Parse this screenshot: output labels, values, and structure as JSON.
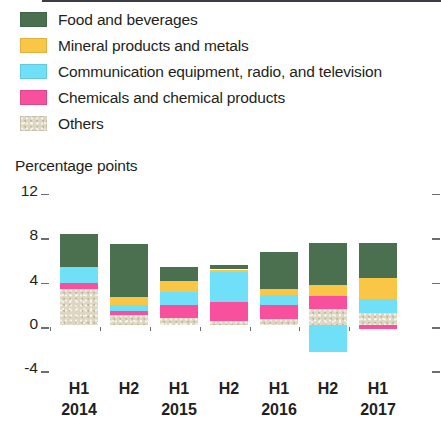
{
  "legend": {
    "items": [
      {
        "label": "Food and beverages",
        "color": "#4a7050",
        "key": "food"
      },
      {
        "label": "Mineral products and metals",
        "color": "#f9c646",
        "key": "mineral"
      },
      {
        "label": "Communication equipment, radio, and television",
        "color": "#6fe0f7",
        "key": "comm"
      },
      {
        "label": "Chemicals and chemical products",
        "color": "#f8509d",
        "key": "chem"
      },
      {
        "label": "Others",
        "color": "#ddd6c1",
        "key": "other"
      }
    ]
  },
  "chart_data": {
    "type": "bar",
    "stacked": true,
    "title": "",
    "subtitle": "",
    "ylabel": "Percentage points",
    "xlabel": "",
    "ylim": [
      -4,
      12
    ],
    "yticks": [
      12,
      8,
      4,
      0,
      -4
    ],
    "ytick_labels": [
      "12",
      "8",
      "4",
      "0",
      "-4"
    ],
    "grid": false,
    "legend_position": "top",
    "categories": [
      "H1",
      "H2",
      "H1",
      "H2",
      "H1",
      "H2",
      "H1"
    ],
    "period_labels": [
      {
        "half": "H1",
        "year": "2014"
      },
      {
        "half": "H2",
        "year": ""
      },
      {
        "half": "H1",
        "year": "2015"
      },
      {
        "half": "H2",
        "year": ""
      },
      {
        "half": "H1",
        "year": "2016"
      },
      {
        "half": "H2",
        "year": ""
      },
      {
        "half": "H1",
        "year": "2017"
      }
    ],
    "years": [
      "2014",
      "2015",
      "2016",
      "2017"
    ],
    "series": [
      {
        "name": "Food and beverages",
        "color": "#4a7050",
        "values": [
          3.0,
          4.8,
          1.2,
          0.4,
          3.4,
          3.8,
          3.2
        ]
      },
      {
        "name": "Mineral products and metals",
        "color": "#f9c646",
        "values": [
          0.0,
          0.7,
          1.0,
          0.2,
          0.5,
          1.0,
          1.9
        ]
      },
      {
        "name": "Communication equipment, radio, and television",
        "color": "#6fe0f7",
        "values": [
          1.4,
          0.5,
          1.2,
          2.7,
          0.9,
          -2.4,
          1.2
        ]
      },
      {
        "name": "Chemicals and chemical products",
        "color": "#f8509d",
        "values": [
          0.6,
          0.4,
          1.2,
          1.7,
          1.3,
          1.2,
          -0.4
        ]
      },
      {
        "name": "Others",
        "color": "#ddd6c1",
        "values": [
          3.2,
          0.9,
          0.6,
          0.4,
          0.5,
          1.4,
          1.1
        ]
      }
    ],
    "totals": [
      8.2,
      7.3,
      5.2,
      5.4,
      6.6,
      7.4,
      7.4
    ]
  }
}
